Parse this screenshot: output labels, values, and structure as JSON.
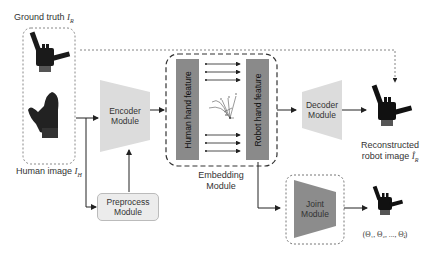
{
  "labels": {
    "ground_truth": "Ground truth ",
    "ground_truth_sym": "I",
    "ground_truth_sub": "R",
    "human_image": "Human image ",
    "human_image_sym": "I",
    "human_image_sub": "H",
    "reconstructed_line1": "Reconstructed",
    "reconstructed_line2": "robot image ",
    "reconstructed_sym": "Î",
    "reconstructed_sub": "R",
    "joint_output": "(Θ₁, Θ₂, ..., Θⱼ)"
  },
  "modules": {
    "encoder": [
      "Encoder",
      "Module"
    ],
    "decoder": [
      "Decoder",
      "Module"
    ],
    "preprocess": [
      "Preprocess",
      "Module"
    ],
    "embedding": [
      "Embedding",
      "Module"
    ],
    "joint": [
      "Joint",
      "Module"
    ]
  },
  "features": {
    "human": "Human hand feature",
    "robot": "Robot hand feature"
  },
  "colors": {
    "trapezoid_light": "#dcdcdc",
    "trapezoid_dark": "#8c8c8c",
    "feature_bar": "#8a8a8a",
    "preprocess_fill": "#ececec",
    "hand_dark": "#1a1a1a"
  }
}
